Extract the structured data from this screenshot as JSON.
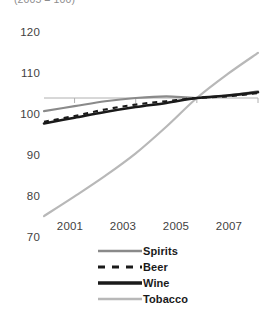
{
  "chart_data": {
    "type": "line",
    "title": "",
    "subtitle": "(2005 = 100)",
    "xlabel": "",
    "ylabel": "",
    "xlim": [
      2000,
      2008
    ],
    "ylim": [
      65,
      124
    ],
    "yticks": [
      70,
      80,
      90,
      100,
      110,
      120
    ],
    "xticks": [
      2001,
      2003,
      2005,
      2007
    ],
    "xtick_labels": [
      "2001",
      "2003",
      "2005",
      "2007"
    ],
    "ytick_labels": [
      "70",
      "80",
      "90",
      "100",
      "110",
      "120"
    ],
    "grid": false,
    "reference_line": 100,
    "legend_position": "bottom",
    "x": [
      2000,
      2001,
      2002,
      2003,
      2004,
      2005,
      2006,
      2007
    ],
    "series": [
      {
        "name": "Spirits",
        "color": "#8a8a8a",
        "style": "solid",
        "width": 2.2,
        "values": [
          96.8,
          98.0,
          99.2,
          100.0,
          100.4,
          100.0,
          100.6,
          101.6
        ]
      },
      {
        "name": "Beer",
        "color": "#1a1a1a",
        "style": "dashed",
        "width": 2.2,
        "values": [
          94.2,
          95.6,
          97.2,
          98.4,
          99.2,
          100.0,
          100.4,
          101.2
        ]
      },
      {
        "name": "Wine",
        "color": "#1a1a1a",
        "style": "solid",
        "width": 2.6,
        "values": [
          93.8,
          95.2,
          96.6,
          97.8,
          98.8,
          100.0,
          100.6,
          101.4
        ]
      },
      {
        "name": "Tobacco",
        "color": "#b8b8b8",
        "style": "solid",
        "width": 2.2,
        "values": [
          71.2,
          76.0,
          81.0,
          86.5,
          93.0,
          100.0,
          105.8,
          111.0
        ]
      }
    ]
  },
  "legend": {
    "items": [
      {
        "label": "Spirits"
      },
      {
        "label": "Beer"
      },
      {
        "label": "Wine"
      },
      {
        "label": "Tobacco"
      }
    ]
  },
  "axes": {
    "y": [
      {
        "label": "120"
      },
      {
        "label": "110"
      },
      {
        "label": "100"
      },
      {
        "label": "90"
      },
      {
        "label": "80"
      },
      {
        "label": "70"
      }
    ],
    "x": [
      {
        "label": "2001"
      },
      {
        "label": "2003"
      },
      {
        "label": "2005"
      },
      {
        "label": "2007"
      }
    ]
  },
  "colors": {
    "spirits": "#8a8a8a",
    "beer": "#1a1a1a",
    "wine": "#1a1a1a",
    "tobacco": "#b8b8b8",
    "axis": "#b0b0b0",
    "text": "#3f3f3f"
  }
}
